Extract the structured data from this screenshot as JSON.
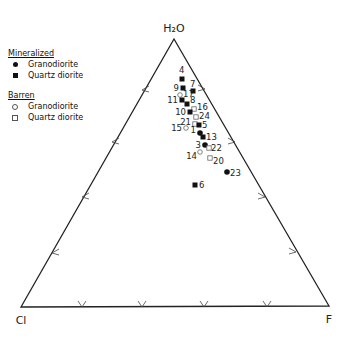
{
  "vertices": {
    "top": {
      "label": "H₂O",
      "x": 174,
      "y": 39
    },
    "left": {
      "label": "Cl",
      "x": 21,
      "y": 307
    },
    "right": {
      "label": "F",
      "x": 329,
      "y": 306
    }
  },
  "legend": {
    "mineralized": {
      "heading": "Mineralized",
      "items": [
        {
          "symbol": "filled-circle",
          "label": "Granodiorite"
        },
        {
          "symbol": "filled-square",
          "label": "Quartz diorite"
        }
      ]
    },
    "barren": {
      "heading": "Barren",
      "items": [
        {
          "symbol": "open-circle",
          "label": "Granodiorite"
        },
        {
          "symbol": "open-square",
          "label": "Quartz diorite"
        }
      ]
    }
  },
  "ticks": {
    "bottom": [
      82,
      142,
      204,
      267
    ],
    "left": [
      [
        142,
        90
      ],
      [
        112,
        142
      ],
      [
        82,
        197
      ],
      [
        52,
        253
      ]
    ],
    "right": [
      [
        205,
        89
      ],
      [
        235,
        142
      ],
      [
        265,
        197
      ],
      [
        296,
        252
      ]
    ]
  },
  "chart_data": {
    "type": "scatter",
    "subtype": "ternary",
    "axes": [
      "H2O",
      "Cl",
      "F"
    ],
    "title": "",
    "legend_position": "top-left",
    "points": [
      {
        "id": "4",
        "group": "Mineralized",
        "rock": "Quartz diorite",
        "symbol": "filled-square",
        "x": 182,
        "y": 79,
        "lx": 179,
        "ly": 73,
        "anchor": "start"
      },
      {
        "id": "9",
        "group": "Mineralized",
        "rock": "Quartz diorite",
        "symbol": "filled-square",
        "x": 183,
        "y": 88,
        "lx": 179,
        "ly": 91,
        "anchor": "end"
      },
      {
        "id": "7",
        "group": "Mineralized",
        "rock": "Quartz diorite",
        "symbol": "filled-square",
        "x": 193,
        "y": 91,
        "lx": 190,
        "ly": 87,
        "anchor": "start"
      },
      {
        "id": "17",
        "group": "Barren",
        "rock": "Granodiorite",
        "symbol": "open-circle",
        "x": 180,
        "y": 95,
        "lx": 183,
        "ly": 97,
        "anchor": "start"
      },
      {
        "id": "11",
        "group": "Mineralized",
        "rock": "Quartz diorite",
        "symbol": "filled-square",
        "x": 182,
        "y": 100,
        "lx": 178,
        "ly": 103,
        "anchor": "end"
      },
      {
        "id": "8",
        "group": "Mineralized",
        "rock": "Quartz diorite",
        "symbol": "filled-square",
        "x": 187,
        "y": 104,
        "lx": 190,
        "ly": 103,
        "anchor": "start"
      },
      {
        "id": "16",
        "group": "Barren",
        "rock": "Quartz diorite",
        "symbol": "open-square",
        "x": 194,
        "y": 109,
        "lx": 197,
        "ly": 110,
        "anchor": "start"
      },
      {
        "id": "10",
        "group": "Mineralized",
        "rock": "Quartz diorite",
        "symbol": "filled-square",
        "x": 190,
        "y": 112,
        "lx": 186,
        "ly": 115,
        "anchor": "end"
      },
      {
        "id": "24",
        "group": "Barren",
        "rock": "Quartz diorite",
        "symbol": "open-square",
        "x": 196,
        "y": 117,
        "lx": 199,
        "ly": 119,
        "anchor": "start"
      },
      {
        "id": "21",
        "group": "Barren",
        "rock": "Quartz diorite",
        "symbol": "open-square",
        "x": 195,
        "y": 124,
        "lx": 191,
        "ly": 125,
        "anchor": "end"
      },
      {
        "id": "5",
        "group": "Mineralized",
        "rock": "Quartz diorite",
        "symbol": "filled-square",
        "x": 199,
        "y": 125,
        "lx": 202,
        "ly": 128,
        "anchor": "start"
      },
      {
        "id": "15",
        "group": "Barren",
        "rock": "Granodiorite",
        "symbol": "open-circle",
        "x": 186,
        "y": 128,
        "lx": 182,
        "ly": 131,
        "anchor": "end"
      },
      {
        "id": "1",
        "group": "Mineralized",
        "rock": "Granodiorite",
        "symbol": "filled-circle",
        "x": 200,
        "y": 133,
        "lx": 196,
        "ly": 133,
        "anchor": "end"
      },
      {
        "id": "13",
        "group": "Mineralized",
        "rock": "Quartz diorite",
        "symbol": "filled-square",
        "x": 203,
        "y": 137,
        "lx": 206,
        "ly": 140,
        "anchor": "start"
      },
      {
        "id": "3",
        "group": "Mineralized",
        "rock": "Granodiorite",
        "symbol": "filled-circle",
        "x": 205,
        "y": 145,
        "lx": 201,
        "ly": 148,
        "anchor": "end"
      },
      {
        "id": "22",
        "group": "Barren",
        "rock": "Quartz diorite",
        "symbol": "open-square",
        "x": 209,
        "y": 148,
        "lx": 211,
        "ly": 151,
        "anchor": "start"
      },
      {
        "id": "14",
        "group": "Barren",
        "rock": "Granodiorite",
        "symbol": "open-circle",
        "x": 200,
        "y": 152,
        "lx": 197,
        "ly": 159,
        "anchor": "end"
      },
      {
        "id": "20",
        "group": "Barren",
        "rock": "Quartz diorite",
        "symbol": "open-square",
        "x": 210,
        "y": 158,
        "lx": 213,
        "ly": 164,
        "anchor": "start"
      },
      {
        "id": "23",
        "group": "Mineralized",
        "rock": "Granodiorite",
        "symbol": "filled-circle",
        "x": 227,
        "y": 172,
        "lx": 230,
        "ly": 176,
        "anchor": "start"
      },
      {
        "id": "6",
        "group": "Mineralized",
        "rock": "Quartz diorite",
        "symbol": "filled-square",
        "x": 195,
        "y": 185,
        "lx": 199,
        "ly": 188,
        "anchor": "start"
      }
    ]
  }
}
